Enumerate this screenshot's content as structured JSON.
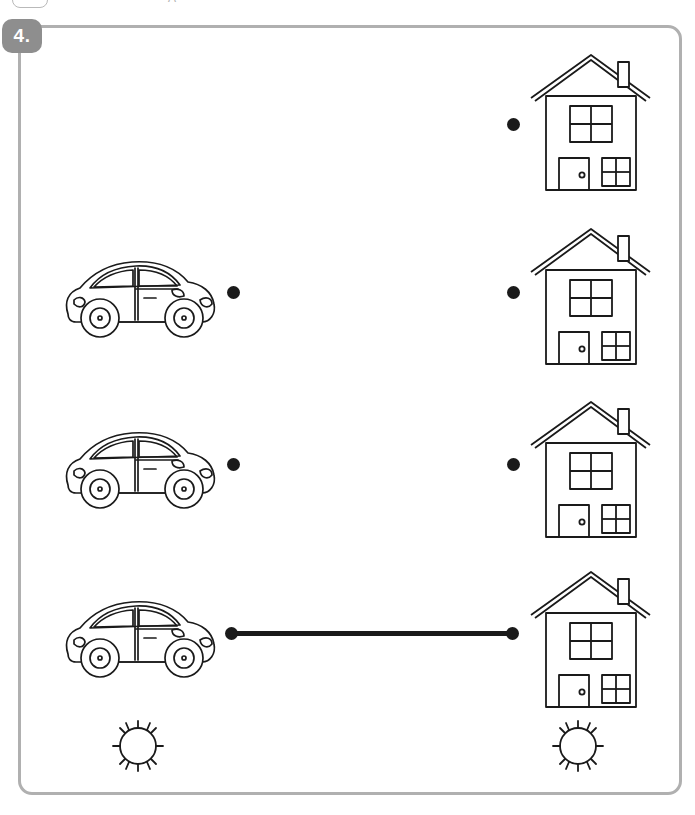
{
  "worksheet": {
    "exercise_number": "4.",
    "frame_color": "#b0b0b0",
    "badge_color": "#8e8e8e",
    "badge_text_color": "#ffffff",
    "ink_color": "#1a1a1a",
    "background_color": "#ffffff",
    "top_artifact_glyphs": [
      "A"
    ],
    "task_type": "matching-lines"
  },
  "items": {
    "left_column_label": "cars",
    "right_column_label": "houses",
    "left_icons": [
      "car-icon",
      "car-icon",
      "car-icon"
    ],
    "right_icons": [
      "house-icon",
      "house-icon",
      "house-icon",
      "house-icon"
    ],
    "bottom_icons": [
      "sun-icon",
      "sun-icon"
    ]
  },
  "rows": [
    {
      "id": "row-1",
      "left_figure": null,
      "right_figure": "house-icon",
      "left_dot": false,
      "right_dot": true,
      "connected": false
    },
    {
      "id": "row-2",
      "left_figure": "car-icon",
      "right_figure": "house-icon",
      "left_dot": true,
      "right_dot": true,
      "connected": false
    },
    {
      "id": "row-3",
      "left_figure": "car-icon",
      "right_figure": "house-icon",
      "left_dot": true,
      "right_dot": true,
      "connected": false
    },
    {
      "id": "row-4",
      "left_figure": "car-icon",
      "right_figure": "house-icon",
      "left_dot": true,
      "right_dot": true,
      "connected": true
    }
  ],
  "bottom_row": {
    "id": "row-5",
    "left_figure": "sun-icon",
    "right_figure": "sun-icon",
    "left_dot": false,
    "right_dot": false,
    "connected": false
  }
}
